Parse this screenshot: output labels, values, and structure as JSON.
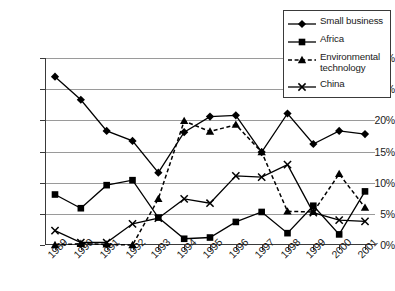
{
  "chart_data": {
    "type": "line",
    "title": "",
    "xlabel": "",
    "ylabel": "",
    "categories": [
      "1989",
      "1990",
      "1991",
      "1992",
      "1993",
      "1994",
      "1995",
      "1996",
      "1997",
      "1998",
      "1999",
      "2000",
      "2001"
    ],
    "ylim": [
      0,
      30
    ],
    "ytick_labels": [
      "0%",
      "5%",
      "10%",
      "15%",
      "20%",
      "25%",
      "30%"
    ],
    "ytick_values": [
      0,
      5,
      10,
      15,
      20,
      25,
      30
    ],
    "grid": true,
    "legend_position": "top-right",
    "series": [
      {
        "name": "Small business",
        "marker": "diamond",
        "line_style": "solid",
        "color": "#000000",
        "values": [
          27.0,
          23.3,
          18.3,
          16.7,
          11.6,
          18.1,
          20.6,
          20.8,
          14.9,
          21.1,
          16.2,
          18.3,
          17.8
        ]
      },
      {
        "name": "Africa",
        "marker": "square",
        "line_style": "solid",
        "color": "#000000",
        "values": [
          8.1,
          5.9,
          9.6,
          10.4,
          4.4,
          1.0,
          1.2,
          3.7,
          5.3,
          1.9,
          6.3,
          1.7,
          8.6
        ]
      },
      {
        "name": "Environmental technology",
        "marker": "triangle",
        "line_style": "dashed",
        "color": "#000000",
        "values": [
          0.0,
          0.2,
          0.1,
          0.0,
          7.4,
          19.9,
          18.2,
          19.3,
          14.9,
          5.4,
          5.3,
          11.4,
          6.0
        ]
      },
      {
        "name": "China",
        "marker": "cross",
        "line_style": "solid",
        "color": "#000000",
        "values": [
          2.3,
          0.4,
          0.4,
          3.4,
          4.3,
          7.4,
          6.7,
          11.1,
          10.9,
          12.9,
          5.2,
          4.0,
          3.8
        ]
      }
    ]
  },
  "legend": {
    "entries": [
      {
        "label": "Small business"
      },
      {
        "label": "Africa"
      },
      {
        "label": "Environmental\ntechnology"
      },
      {
        "label": "China"
      }
    ]
  }
}
